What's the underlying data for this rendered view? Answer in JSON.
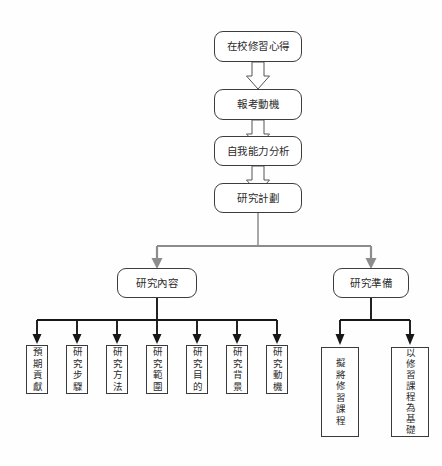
{
  "diagram": {
    "title": "",
    "type": "flowchart",
    "background_color": "#fefefe",
    "colors": {
      "node_border": "#3d3d3d",
      "node_fill": "#ffffff",
      "text": "#2b2b2b",
      "gray_connector": "#8c8c8c",
      "black_connector": "#171717",
      "block_arrow_stroke": "#555555"
    },
    "chain": [
      {
        "id": "n1",
        "label": "在校修習心得",
        "shape": "rounded-rect",
        "orientation": "horizontal"
      },
      {
        "id": "n2",
        "label": "報考動機",
        "shape": "rounded-rect",
        "orientation": "horizontal"
      },
      {
        "id": "n3",
        "label": "自我能力分析",
        "shape": "rounded-rect",
        "orientation": "horizontal"
      },
      {
        "id": "n4",
        "label": "研究計劃",
        "shape": "rounded-rect",
        "orientation": "horizontal"
      }
    ],
    "branches": [
      {
        "id": "b1",
        "label": "研究內容",
        "shape": "rounded-rect",
        "orientation": "horizontal"
      },
      {
        "id": "b2",
        "label": "研究準備",
        "shape": "rounded-rect",
        "orientation": "horizontal"
      }
    ],
    "content_children": [
      {
        "id": "c1",
        "label": "預期貢獻",
        "shape": "rect",
        "orientation": "vertical"
      },
      {
        "id": "c2",
        "label": "研究步驟",
        "shape": "rect",
        "orientation": "vertical"
      },
      {
        "id": "c3",
        "label": "研究方法",
        "shape": "rect",
        "orientation": "vertical"
      },
      {
        "id": "c4",
        "label": "研究範圍",
        "shape": "rect",
        "orientation": "vertical"
      },
      {
        "id": "c5",
        "label": "研究目的",
        "shape": "rect",
        "orientation": "vertical"
      },
      {
        "id": "c6",
        "label": "研究背景",
        "shape": "rect",
        "orientation": "vertical"
      },
      {
        "id": "c7",
        "label": "研究動機",
        "shape": "rect",
        "orientation": "vertical"
      }
    ],
    "prep_children": [
      {
        "id": "p1",
        "label": "擬將修習課程",
        "shape": "rect",
        "orientation": "vertical"
      },
      {
        "id": "p2",
        "label": "以修習課程為基礎",
        "shape": "rect",
        "orientation": "vertical"
      }
    ],
    "connectors": [
      {
        "from": "n1",
        "to": "n2",
        "style": "hollow-block-arrow-down"
      },
      {
        "from": "n2",
        "to": "n3",
        "style": "hollow-block-arrow-down"
      },
      {
        "from": "n3",
        "to": "n4",
        "style": "hollow-block-arrow-down"
      },
      {
        "from": "n4",
        "to": "b1",
        "style": "gray-elbow-arrow"
      },
      {
        "from": "n4",
        "to": "b2",
        "style": "gray-elbow-arrow"
      },
      {
        "from": "b1",
        "to": "c1",
        "style": "black-elbow-arrow"
      },
      {
        "from": "b1",
        "to": "c2",
        "style": "black-elbow-arrow"
      },
      {
        "from": "b1",
        "to": "c3",
        "style": "black-elbow-arrow"
      },
      {
        "from": "b1",
        "to": "c4",
        "style": "black-elbow-arrow"
      },
      {
        "from": "b1",
        "to": "c5",
        "style": "black-elbow-arrow"
      },
      {
        "from": "b1",
        "to": "c6",
        "style": "black-elbow-arrow"
      },
      {
        "from": "b1",
        "to": "c7",
        "style": "black-elbow-arrow"
      },
      {
        "from": "b2",
        "to": "p1",
        "style": "black-elbow-arrow"
      },
      {
        "from": "b2",
        "to": "p2",
        "style": "black-elbow-arrow"
      }
    ]
  }
}
